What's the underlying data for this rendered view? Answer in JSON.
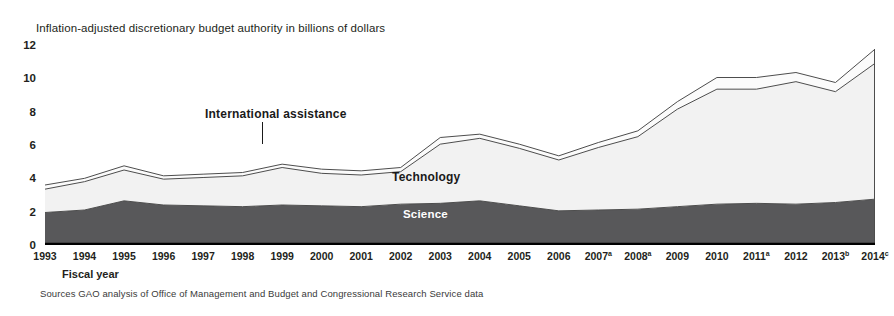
{
  "chart": {
    "title": "Inflation-adjusted discretionary budget authority in billions of dollars",
    "axis_caption": "Fiscal year",
    "source_note": "Sources  GAO analysis of Office of Management and Budget and Congressional Research Service data",
    "labels": {
      "international_assistance": "International assistance",
      "technology": "Technology",
      "science": "Science"
    },
    "colors": {
      "science": "#58585a",
      "technology": "#f2f2f2",
      "international_assistance": "#fbfbfb",
      "outline": "#4d4d4d",
      "axis": "#000000",
      "text": "#231f20"
    }
  },
  "chart_data": {
    "type": "area",
    "stacked": true,
    "title": "Inflation-adjusted discretionary budget authority in billions of dollars",
    "xlabel": "Fiscal year",
    "ylabel": "Inflation-adjusted discretionary budget authority in billions of dollars",
    "ylim": [
      0,
      12
    ],
    "yticks": [
      0,
      2,
      4,
      6,
      8,
      10,
      12
    ],
    "grid": false,
    "legend": "in-plot annotations",
    "categories": [
      "1993",
      "1994",
      "1995",
      "1996",
      "1997",
      "1998",
      "1999",
      "2000",
      "2001",
      "2002",
      "2003",
      "2004",
      "2005",
      "2006",
      "2007",
      "2008",
      "2009",
      "2010",
      "2011",
      "2012",
      "2013",
      "2014"
    ],
    "category_footnotes": {
      "2007": "a",
      "2008": "a",
      "2011": "a",
      "2013": "b",
      "2014": "c"
    },
    "series": [
      {
        "name": "Science",
        "color": "#58585a",
        "values": [
          1.95,
          2.1,
          2.65,
          2.4,
          2.35,
          2.3,
          2.4,
          2.35,
          2.3,
          2.45,
          2.5,
          2.65,
          2.35,
          2.05,
          2.1,
          2.15,
          2.3,
          2.45,
          2.5,
          2.45,
          2.55,
          2.75
        ]
      },
      {
        "name": "Technology",
        "color": "#f2f2f2",
        "values": [
          1.4,
          1.7,
          1.85,
          1.55,
          1.7,
          1.85,
          2.25,
          1.95,
          1.9,
          1.95,
          3.55,
          3.75,
          3.45,
          3.05,
          3.75,
          4.35,
          5.85,
          6.9,
          6.85,
          7.35,
          6.65,
          8.15
        ]
      },
      {
        "name": "International assistance",
        "color": "#fbfbfb",
        "values": [
          0.25,
          0.2,
          0.25,
          0.2,
          0.2,
          0.2,
          0.2,
          0.25,
          0.25,
          0.25,
          0.4,
          0.25,
          0.25,
          0.25,
          0.3,
          0.35,
          0.45,
          0.7,
          0.7,
          0.55,
          0.55,
          0.85
        ]
      }
    ],
    "totals": [
      3.6,
      4.0,
      4.75,
      4.15,
      4.25,
      4.35,
      4.85,
      4.55,
      4.45,
      4.65,
      6.45,
      6.65,
      6.05,
      5.35,
      6.15,
      6.85,
      8.6,
      10.05,
      10.05,
      10.35,
      9.75,
      11.75
    ]
  }
}
